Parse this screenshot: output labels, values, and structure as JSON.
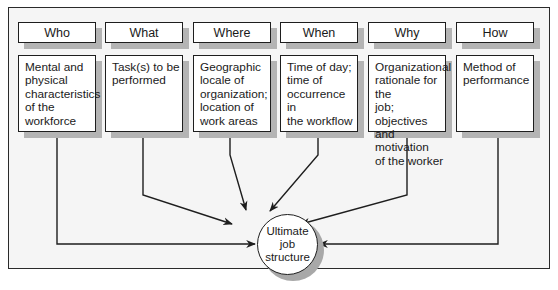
{
  "diagram": {
    "columns": [
      {
        "key": "who",
        "header": "Who",
        "body": [
          "Mental and",
          "physical",
          "characteristics",
          "of the",
          "workforce"
        ]
      },
      {
        "key": "what",
        "header": "What",
        "body": [
          "Task(s) to be",
          "performed"
        ]
      },
      {
        "key": "where",
        "header": "Where",
        "body": [
          "Geographic",
          "locale of",
          "organization;",
          "location of",
          "work areas"
        ]
      },
      {
        "key": "when",
        "header": "When",
        "body": [
          "Time of day;",
          "time of",
          "occurrence in",
          "the workflow"
        ]
      },
      {
        "key": "why",
        "header": "Why",
        "body": [
          "Organizational",
          "rationale for the",
          "job; objectives",
          "and motivation",
          "of the worker"
        ]
      },
      {
        "key": "how",
        "header": "How",
        "body": [
          "Method of",
          "performance"
        ]
      }
    ],
    "center": {
      "lines": [
        "Ultimate",
        "job",
        "structure"
      ]
    },
    "colors": {
      "frame_bg": "#f5f5f5",
      "shadow": "#b4b4b4",
      "stroke": "#1e1e1e",
      "box_bg": "#ffffff"
    }
  }
}
